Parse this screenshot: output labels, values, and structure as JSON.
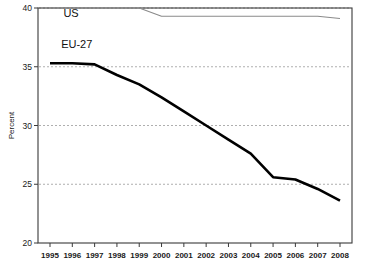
{
  "chart_data": {
    "type": "line",
    "title": "",
    "xlabel": "",
    "ylabel": "Percent",
    "xlim": [
      1994.5,
      2008.5
    ],
    "ylim": [
      20,
      40
    ],
    "grid": true,
    "grid_axis": "y",
    "legend_position": "inline-labels",
    "x": [
      1995,
      1996,
      1997,
      1998,
      1999,
      2000,
      2001,
      2002,
      2003,
      2004,
      2005,
      2006,
      2007,
      2008
    ],
    "xtick_labels": [
      "1995",
      "1996",
      "1997",
      "1998",
      "1999",
      "2000",
      "2001",
      "2002",
      "2003",
      "2004",
      "2005",
      "2006",
      "2007",
      "2008"
    ],
    "ytick_labels": [
      "20",
      "25",
      "30",
      "35",
      "40"
    ],
    "yticks": [
      20,
      25,
      30,
      35,
      40
    ],
    "gridline_values": [
      25,
      30,
      35,
      40
    ],
    "series": [
      {
        "name": "US",
        "color": "#8a8a8a",
        "line_width": "thin",
        "label_x": 1995.6,
        "label_y": 39.2,
        "values": [
          40.0,
          40.0,
          40.0,
          40.0,
          40.0,
          39.3,
          39.3,
          39.3,
          39.3,
          39.3,
          39.3,
          39.3,
          39.3,
          39.1
        ]
      },
      {
        "name": "EU-27",
        "color": "#000000",
        "line_width": "thick",
        "label_x": 1995.5,
        "label_y": 36.6,
        "values": [
          35.3,
          35.3,
          35.2,
          34.3,
          33.5,
          32.4,
          31.2,
          30.0,
          28.8,
          27.6,
          25.6,
          25.4,
          24.6,
          23.6
        ]
      }
    ]
  }
}
